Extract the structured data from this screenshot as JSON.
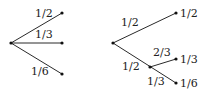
{
  "diagram": {
    "type": "probability-tree",
    "left_tree": {
      "edge_labels": [
        "1/2",
        "1/3",
        "1/6"
      ]
    },
    "right_tree": {
      "edge_labels": {
        "root_upper": "1/2",
        "root_lower": "1/2",
        "inner_upper": "2/3",
        "inner_lower": "1/3"
      },
      "leaf_labels": [
        "1/2",
        "1/3",
        "1/6"
      ]
    },
    "colors": {
      "line": "#2a2a2a",
      "node": "#111111",
      "text": "#222222",
      "background": "#ffffff"
    }
  }
}
